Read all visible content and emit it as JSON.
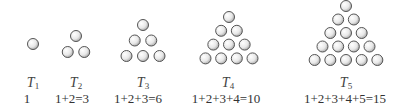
{
  "figures": [
    {
      "label": "T",
      "index": "1",
      "formula": "1",
      "rows": 1,
      "cx": 33,
      "top_y": 44,
      "spacing": 16,
      "r": 5.5
    },
    {
      "label": "T",
      "index": "2",
      "formula": "1+2=3",
      "rows": 2,
      "cx": 76,
      "top_y": 36,
      "spacing": 16,
      "r": 5.5
    },
    {
      "label": "T",
      "index": "3",
      "formula": "1+2+3=6",
      "rows": 3,
      "cx": 143,
      "top_y": 25,
      "spacing": 15.5,
      "r": 5.5
    },
    {
      "label": "T",
      "index": "4",
      "formula": "1+2+3+4=10",
      "rows": 4,
      "cx": 229,
      "top_y": 17,
      "spacing": 13.8,
      "r": 5.5
    },
    {
      "label": "T",
      "index": "5",
      "formula": "1+2+3+4+5=15",
      "rows": 5,
      "cx": 346,
      "top_y": 6,
      "spacing": 13.5,
      "r": 5.5
    }
  ],
  "colors": {
    "stroke": "#555555",
    "fill_light": "#ffffff",
    "fill_dark": "#bdbdbd"
  }
}
